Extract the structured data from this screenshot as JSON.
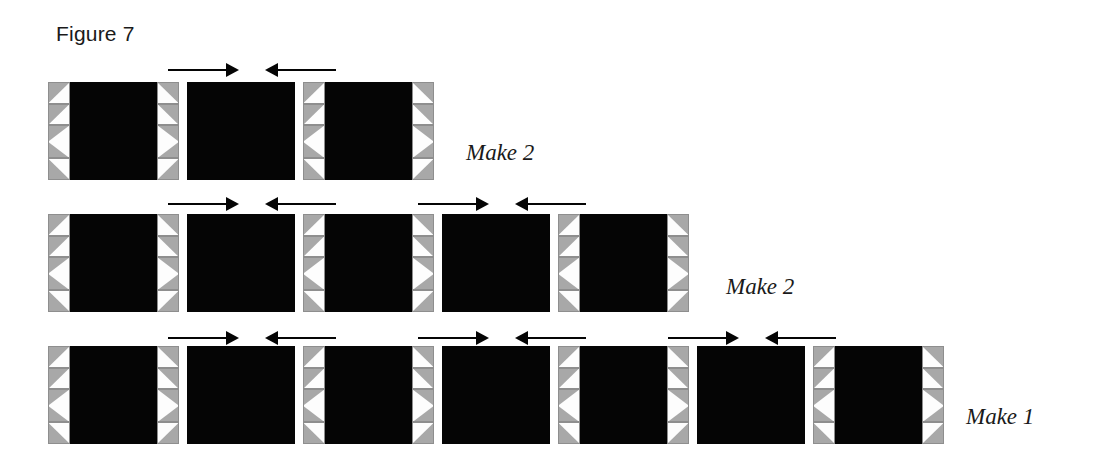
{
  "figure": {
    "title": "Figure 7",
    "title_x": 56,
    "title_y": 22
  },
  "colors": {
    "fabric_dark": "#050505",
    "fabric_gray": "#a8a8a8",
    "fabric_light": "#fdfdfd",
    "outline": "#8e8e8e",
    "arrow": "#050505",
    "text": "#1a1a1a"
  },
  "geometry": {
    "block_width": 131,
    "plain_width": 108,
    "block_height": 98,
    "strip_width": 22,
    "gap": 8,
    "arrow_shaft_length": 58,
    "arrow_head_length": 13
  },
  "rows": [
    {
      "name": "row-1",
      "x": 48,
      "y": 82,
      "label": "Make 2",
      "label_x": 466,
      "label_y": 140,
      "blocks": [
        {
          "type": "pieced",
          "width": 131
        },
        {
          "type": "plain",
          "width": 108
        },
        {
          "type": "pieced",
          "width": 131
        }
      ],
      "arrow_pairs": [
        {
          "x": 168,
          "y": 62
        }
      ]
    },
    {
      "name": "row-2",
      "x": 48,
      "y": 214,
      "label": "Make 2",
      "label_x": 726,
      "label_y": 274,
      "blocks": [
        {
          "type": "pieced",
          "width": 131
        },
        {
          "type": "plain",
          "width": 108
        },
        {
          "type": "pieced",
          "width": 131
        },
        {
          "type": "plain",
          "width": 108
        },
        {
          "type": "pieced",
          "width": 131
        }
      ],
      "arrow_pairs": [
        {
          "x": 168,
          "y": 196
        },
        {
          "x": 418,
          "y": 196
        }
      ]
    },
    {
      "name": "row-3",
      "x": 48,
      "y": 346,
      "label": "Make 1",
      "label_x": 966,
      "label_y": 404,
      "blocks": [
        {
          "type": "pieced",
          "width": 131
        },
        {
          "type": "plain",
          "width": 108
        },
        {
          "type": "pieced",
          "width": 131
        },
        {
          "type": "plain",
          "width": 108
        },
        {
          "type": "pieced",
          "width": 131
        },
        {
          "type": "plain",
          "width": 108
        },
        {
          "type": "pieced",
          "width": 131
        }
      ],
      "arrow_pairs": [
        {
          "x": 168,
          "y": 330
        },
        {
          "x": 418,
          "y": 330
        },
        {
          "x": 668,
          "y": 330
        }
      ]
    }
  ],
  "strip_units": [
    {
      "kind": "hst",
      "height_pct": 22
    },
    {
      "kind": "hst",
      "height_pct": 22
    },
    {
      "kind": "geese",
      "height_pct": 34
    },
    {
      "kind": "hst",
      "height_pct": 22
    }
  ]
}
